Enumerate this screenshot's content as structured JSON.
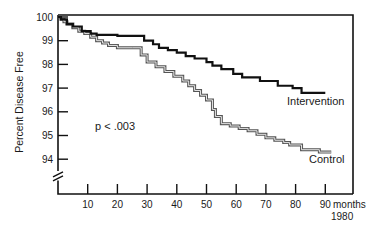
{
  "chart_data": {
    "type": "line",
    "subtype": "step (Kaplan-Meier style)",
    "title": "",
    "xlabel": "months",
    "xlabel_extra": "1980",
    "ylabel": "Percent Disease Free",
    "xlim": [
      0,
      99
    ],
    "ylim": [
      93,
      100
    ],
    "y_axis_break": true,
    "grid": false,
    "x_ticks": [
      10,
      20,
      30,
      40,
      50,
      60,
      70,
      80,
      90
    ],
    "y_ticks": [
      94,
      95,
      96,
      97,
      98,
      99,
      100
    ],
    "annotations": [
      {
        "text": "p < .003",
        "x": 14,
        "y": 95.6
      }
    ],
    "legend": "inline labels at line ends",
    "series": [
      {
        "name": "Intervention",
        "style": "solid black, thick",
        "color": "#111111",
        "x": [
          0,
          1,
          3,
          5,
          8,
          11,
          13,
          20,
          29,
          32,
          34,
          37,
          40,
          43,
          46,
          50,
          52,
          55,
          59,
          62,
          68,
          74,
          79,
          82,
          90
        ],
        "y": [
          100,
          99.9,
          99.7,
          99.6,
          99.4,
          99.3,
          99.25,
          99.2,
          99.0,
          98.85,
          98.7,
          98.6,
          98.5,
          98.35,
          98.25,
          98.1,
          97.95,
          97.8,
          97.6,
          97.45,
          97.3,
          97.1,
          97.0,
          96.8,
          96.8
        ]
      },
      {
        "name": "Control",
        "style": "double line, gray outline",
        "color": "#888888",
        "x": [
          0,
          1,
          2,
          3,
          5,
          7,
          9,
          11,
          13,
          15,
          17,
          20,
          25,
          28,
          30,
          33,
          36,
          39,
          42,
          44,
          46,
          48,
          50,
          52,
          53,
          55,
          58,
          61,
          64,
          67,
          70,
          73,
          76,
          78,
          82,
          88,
          92
        ],
        "y": [
          100,
          99.9,
          99.8,
          99.7,
          99.55,
          99.4,
          99.3,
          99.15,
          99.0,
          98.9,
          98.8,
          98.7,
          98.7,
          98.4,
          98.1,
          97.9,
          97.7,
          97.5,
          97.3,
          97.1,
          96.9,
          96.7,
          96.5,
          96.1,
          95.8,
          95.5,
          95.4,
          95.3,
          95.2,
          95.05,
          94.9,
          94.8,
          94.7,
          94.6,
          94.4,
          94.3,
          94.3
        ]
      }
    ]
  },
  "labels": {
    "ylabel": "Percent Disease Free",
    "x_unit": "months",
    "x_year": "1980",
    "pvalue": "p < .003",
    "intervention": "Intervention",
    "control": "Control"
  }
}
